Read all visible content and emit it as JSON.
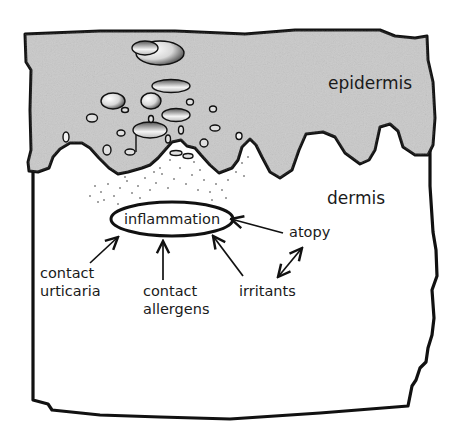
{
  "diagram": {
    "layers": {
      "epidermis": {
        "label": "epidermis",
        "fill": "#c8c8c8"
      },
      "dermis": {
        "label": "dermis",
        "fill": "#ffffff"
      }
    },
    "center_node": {
      "label": "inflammation"
    },
    "factors": [
      {
        "id": "contact-urticaria",
        "line1": "contact",
        "line2": "urticaria"
      },
      {
        "id": "contact-allergens",
        "line1": "contact",
        "line2": "allergens"
      },
      {
        "id": "irritants",
        "line1": "irritants"
      },
      {
        "id": "atopy",
        "line1": "atopy"
      }
    ],
    "relations": [
      {
        "from": "contact urticaria",
        "to": "inflammation",
        "type": "arrow"
      },
      {
        "from": "contact allergens",
        "to": "inflammation",
        "type": "arrow"
      },
      {
        "from": "irritants",
        "to": "inflammation",
        "type": "arrow"
      },
      {
        "from": "atopy",
        "to": "inflammation",
        "type": "arrow"
      },
      {
        "from": "atopy",
        "to": "irritants",
        "type": "double-arrow"
      }
    ],
    "colors": {
      "outline": "#111111",
      "text": "#1a1a1a"
    }
  }
}
